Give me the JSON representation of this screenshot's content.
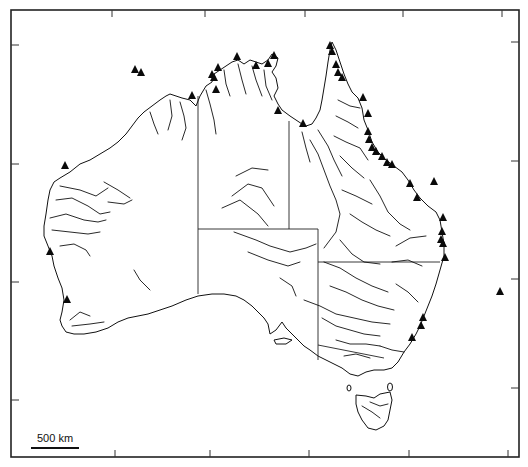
{
  "map": {
    "title": "",
    "region": "Australia",
    "colors": {
      "background": "#ffffff",
      "ink": "#111111",
      "marker": "#0a0a0a"
    },
    "frame": {
      "x": 11,
      "y": 10,
      "width": 508,
      "height": 447
    },
    "ticks": {
      "top_x": [
        112,
        205,
        305,
        403,
        502
      ],
      "bottom_x": [
        115,
        210,
        309,
        409,
        508
      ],
      "left_y": [
        45,
        164,
        282,
        400
      ],
      "right_y": [
        42,
        161,
        279,
        388
      ]
    },
    "scale_bar": {
      "label": "500 km",
      "length_px": 48
    },
    "marker_symbol": "filled-triangle",
    "markers": [
      [
        135,
        70
      ],
      [
        141,
        73
      ],
      [
        212,
        75
      ],
      [
        218,
        68
      ],
      [
        214,
        78
      ],
      [
        237,
        57
      ],
      [
        256,
        66
      ],
      [
        274,
        56
      ],
      [
        268,
        64
      ],
      [
        216,
        90
      ],
      [
        192,
        96
      ],
      [
        278,
        111
      ],
      [
        330,
        46
      ],
      [
        332,
        52
      ],
      [
        336,
        65
      ],
      [
        338,
        73
      ],
      [
        342,
        78
      ],
      [
        303,
        124
      ],
      [
        363,
        98
      ],
      [
        368,
        114
      ],
      [
        368,
        132
      ],
      [
        369,
        140
      ],
      [
        372,
        148
      ],
      [
        376,
        152
      ],
      [
        382,
        157
      ],
      [
        387,
        163
      ],
      [
        392,
        165
      ],
      [
        410,
        184
      ],
      [
        434,
        182
      ],
      [
        417,
        198
      ],
      [
        443,
        218
      ],
      [
        442,
        232
      ],
      [
        441,
        240
      ],
      [
        443,
        244
      ],
      [
        445,
        258
      ],
      [
        500,
        292
      ],
      [
        423,
        318
      ],
      [
        421,
        326
      ],
      [
        412,
        338
      ],
      [
        65,
        166
      ],
      [
        50,
        252
      ],
      [
        67,
        300
      ]
    ]
  }
}
